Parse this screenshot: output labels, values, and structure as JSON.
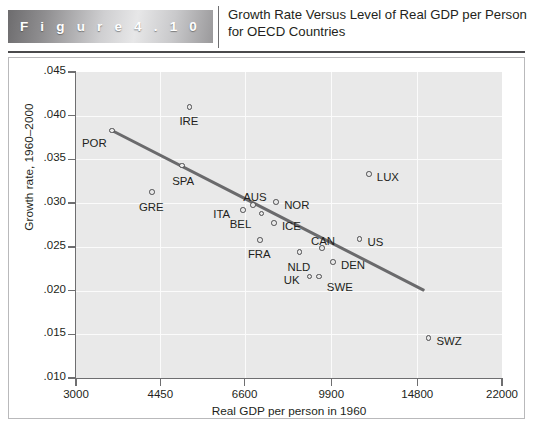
{
  "figure": {
    "band_label": "F i g u r e   4 . 1 0",
    "title": "Growth Rate Versus Level of Real GDP per Person for OECD Countries"
  },
  "chart_data": {
    "type": "scatter",
    "title": "Growth Rate Versus Level of Real GDP per Person for OECD Countries",
    "xlabel": "Real GDP per person in 1960",
    "ylabel": "Growth rate, 1960–2000",
    "xscale": "log",
    "xlim": [
      3000,
      22000
    ],
    "ylim": [
      0.01,
      0.045
    ],
    "xticks": [
      3000,
      4450,
      6600,
      9900,
      14800,
      22000
    ],
    "xtick_labels": [
      "3000",
      "4450",
      "6600",
      "9900",
      "14800",
      "22000"
    ],
    "yticks": [
      0.01,
      0.015,
      0.02,
      0.025,
      0.03,
      0.035,
      0.04,
      0.045
    ],
    "ytick_labels": [
      ".010",
      ".015",
      ".020",
      ".025",
      ".030",
      ".035",
      ".040",
      ".045"
    ],
    "grid": true,
    "legend": "none",
    "points": [
      {
        "label": "POR",
        "x": 3550,
        "y": 0.0383,
        "label_dx": -30,
        "label_dy": 13
      },
      {
        "label": "IRE",
        "x": 5100,
        "y": 0.041,
        "label_dx": -10,
        "label_dy": 15
      },
      {
        "label": "SPA",
        "x": 4930,
        "y": 0.0343,
        "label_dx": -10,
        "label_dy": 16
      },
      {
        "label": "GRE",
        "x": 4280,
        "y": 0.0313,
        "label_dx": -13,
        "label_dy": 16
      },
      {
        "label": "ITA",
        "x": 6560,
        "y": 0.0292,
        "label_dx": -30,
        "label_dy": 5
      },
      {
        "label": "AUS",
        "x": 6870,
        "y": 0.0298,
        "label_dx": -10,
        "label_dy": -7
      },
      {
        "label": "BEL",
        "x": 7150,
        "y": 0.0288,
        "label_dx": -32,
        "label_dy": 11
      },
      {
        "label": "NOR",
        "x": 7650,
        "y": 0.0301,
        "label_dx": 8,
        "label_dy": 4
      },
      {
        "label": "ICE",
        "x": 7570,
        "y": 0.0277,
        "label_dx": 8,
        "label_dy": 4
      },
      {
        "label": "FRA",
        "x": 7090,
        "y": 0.0258,
        "label_dx": -12,
        "label_dy": 15
      },
      {
        "label": "NLD",
        "x": 8530,
        "y": 0.0244,
        "label_dx": -12,
        "label_dy": 16
      },
      {
        "label": "CAN",
        "x": 9480,
        "y": 0.0249,
        "label_dx": -11,
        "label_dy": -6
      },
      {
        "label": "US",
        "x": 11300,
        "y": 0.0259,
        "label_dx": 8,
        "label_dy": 4
      },
      {
        "label": "DEN",
        "x": 9980,
        "y": 0.0233,
        "label_dx": 8,
        "label_dy": 4
      },
      {
        "label": "UK",
        "x": 8950,
        "y": 0.0216,
        "label_dx": -26,
        "label_dy": 4
      },
      {
        "label": "SWE",
        "x": 9340,
        "y": 0.0216,
        "label_dx": 8,
        "label_dy": 11
      },
      {
        "label": "LUX",
        "x": 11800,
        "y": 0.0333,
        "label_dx": 8,
        "label_dy": 4
      },
      {
        "label": "SWZ",
        "x": 15600,
        "y": 0.0146,
        "label_dx": 8,
        "label_dy": 4
      }
    ],
    "trendline": {
      "x_start": 3550,
      "y_start": 0.0383,
      "x_end": 15300,
      "y_end": 0.02,
      "color": "#6a6a6c"
    }
  }
}
